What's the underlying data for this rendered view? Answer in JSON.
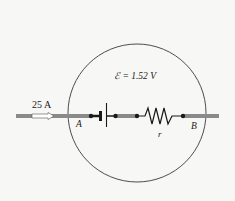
{
  "diagram": {
    "type": "circuit-segment",
    "emf_label": "ℰ = 1.52 V",
    "current_label": "25 A",
    "point_a_label": "A",
    "point_b_label": "B",
    "resistor_label": "r",
    "components": [
      "battery",
      "internal-resistance"
    ],
    "colors": {
      "wire": "#8a8a8a",
      "circle": "#3a3a3a",
      "arrow_fill": "#ffffff"
    }
  }
}
